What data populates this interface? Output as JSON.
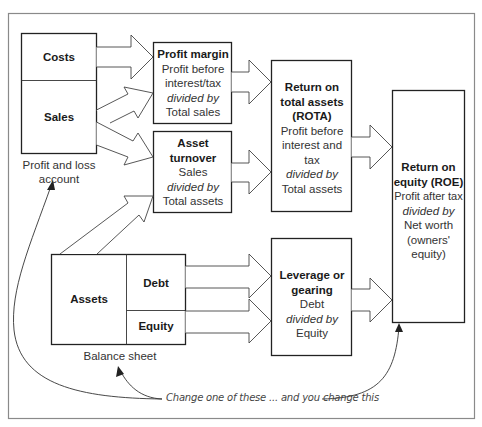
{
  "diagram": {
    "profit_loss": {
      "costs": "Costs",
      "sales": "Sales",
      "caption_line1": "Profit and loss",
      "caption_line2": "account"
    },
    "balance_sheet": {
      "assets": "Assets",
      "debt": "Debt",
      "equity": "Equity",
      "caption": "Balance sheet"
    },
    "profit_margin": {
      "title": "Profit margin",
      "line1": "Profit before",
      "line2": "interest/tax",
      "divided": "divided by",
      "line3": "Total sales"
    },
    "asset_turnover": {
      "title1": "Asset",
      "title2": "turnover",
      "line1": "Sales",
      "divided": "divided by",
      "line2": "Total assets"
    },
    "rota": {
      "title1": "Return on",
      "title2": "total assets",
      "title3": "(ROTA)",
      "line1": "Profit before",
      "line2": "interest and",
      "line3": "tax",
      "divided": "divided by",
      "line4": "Total assets"
    },
    "leverage": {
      "title1": "Leverage or",
      "title2": "gearing",
      "line1": "Debt",
      "divided": "divided by",
      "line2": "Equity"
    },
    "roe": {
      "title1": "Return on",
      "title2": "equity (ROE)",
      "line1": "Profit after tax",
      "divided": "divided by",
      "line2": "Net worth",
      "line3": "(owners'",
      "line4": "equity)"
    },
    "annotation": "Change one of these ... and you change this",
    "colors": {
      "frame": "#8a8a8a",
      "box_border": "#222222",
      "arrow": "#444444"
    }
  }
}
